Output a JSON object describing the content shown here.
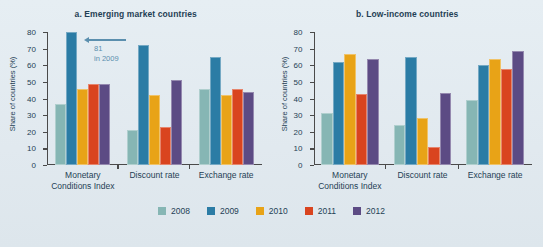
{
  "figure": {
    "background": "#e4ecf1",
    "legend_position": "bottom-center"
  },
  "series_colors": {
    "2008": "#86b6b4",
    "2009": "#2b7ca5",
    "2010": "#e8a317",
    "2011": "#d9441f",
    "2012": "#5c4b84"
  },
  "legend": {
    "items": [
      {
        "label": "2008",
        "color": "#86b6b4"
      },
      {
        "label": "2009",
        "color": "#2b7ca5"
      },
      {
        "label": "2010",
        "color": "#e8a317"
      },
      {
        "label": "2011",
        "color": "#d9441f"
      },
      {
        "label": "2012",
        "color": "#5c4b84"
      }
    ]
  },
  "axis": {
    "ylabel": "Share of countries (%)",
    "ticks": [
      "80",
      "70",
      "60",
      "50",
      "40",
      "30",
      "20",
      "10",
      "0"
    ],
    "ymin": 0,
    "ymax": 80
  },
  "panels": [
    {
      "title": "a. Emerging market countries",
      "annotation": {
        "value": "81",
        "note": "in 2009"
      }
    },
    {
      "title": "b. Low-income countries"
    }
  ],
  "chart_data": [
    {
      "type": "bar",
      "title": "a. Emerging market countries",
      "xlabel": "",
      "ylabel": "Share of countries (%)",
      "ylim": [
        0,
        80
      ],
      "grid": false,
      "legend": "bottom",
      "categories": [
        "Monetary Conditions Index",
        "Discount rate",
        "Exchange rate"
      ],
      "series": [
        {
          "name": "2008",
          "color": "#86b6b4",
          "values": [
            37,
            21,
            46
          ]
        },
        {
          "name": "2009",
          "color": "#2b7ca5",
          "values": [
            81,
            72,
            65
          ]
        },
        {
          "name": "2010",
          "color": "#e8a317",
          "values": [
            46,
            42,
            42
          ]
        },
        {
          "name": "2011",
          "color": "#d9441f",
          "values": [
            49,
            23,
            46
          ]
        },
        {
          "name": "2012",
          "color": "#5c4b84",
          "values": [
            48.5,
            51,
            44
          ]
        }
      ],
      "annotations": [
        {
          "text": "81 in 2009",
          "target_series": "2009",
          "target_category": "Monetary Conditions Index",
          "note": "bar clipped at axis maximum of 80"
        }
      ]
    },
    {
      "type": "bar",
      "title": "b. Low-income countries",
      "xlabel": "",
      "ylabel": "Share of countries (%)",
      "ylim": [
        0,
        80
      ],
      "grid": false,
      "legend": "bottom",
      "categories": [
        "Monetary Conditions Index",
        "Discount rate",
        "Exchange rate"
      ],
      "series": [
        {
          "name": "2008",
          "color": "#86b6b4",
          "values": [
            31,
            24,
            39
          ]
        },
        {
          "name": "2009",
          "color": "#2b7ca5",
          "values": [
            62,
            65,
            60
          ]
        },
        {
          "name": "2010",
          "color": "#e8a317",
          "values": [
            67,
            28,
            64
          ]
        },
        {
          "name": "2011",
          "color": "#d9441f",
          "values": [
            43,
            11,
            58
          ]
        },
        {
          "name": "2012",
          "color": "#5c4b84",
          "values": [
            64,
            43.5,
            68.5
          ]
        }
      ]
    }
  ],
  "xlabels": [
    {
      "line1": "Monetary",
      "line2": "Conditions Index"
    },
    {
      "line1": "Discount rate",
      "line2": ""
    },
    {
      "line1": "Exchange rate",
      "line2": ""
    }
  ]
}
